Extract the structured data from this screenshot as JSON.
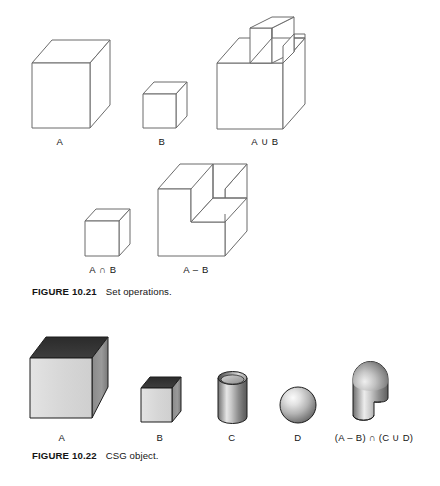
{
  "page": {
    "width": 440,
    "height": 486,
    "background": "#ffffff",
    "ink": "#141414"
  },
  "figures": [
    {
      "id": "figure-10-21",
      "caption_title": "FIGURE 10.21",
      "caption_text": "Set operations.",
      "style": "wireframe line drawing",
      "stroke_color": "#6b6b6b",
      "fill_color": "#ffffff",
      "shapes": [
        {
          "name": "cube-a",
          "label": "A",
          "label_x": 60,
          "label_y": 142,
          "description": "large wireframe cube"
        },
        {
          "name": "cube-b",
          "label": "B",
          "label_x": 162,
          "label_y": 142,
          "description": "small wireframe cube"
        },
        {
          "name": "union-a-b",
          "label": "A ∪ B",
          "label_x": 265,
          "label_y": 142,
          "description": "large cube with small cube fused on top rear corner"
        },
        {
          "name": "intersection-a-b",
          "label": "A ∩ B",
          "label_x": 103,
          "label_y": 270,
          "description": "small wireframe cube"
        },
        {
          "name": "difference-a-b",
          "label": "A – B",
          "label_x": 196,
          "label_y": 270,
          "description": "large cube with a cubic notch removed from top front right corner"
        }
      ]
    },
    {
      "id": "figure-10-22",
      "caption_title": "FIGURE 10.22",
      "caption_text": "CSG object.",
      "style": "shaded grayscale solids",
      "colors": {
        "top_face": "#333333",
        "front_face": "#d9d9d9",
        "side_face": "#8f8f8f",
        "outline": "#1a1a1a",
        "highlight": "#f2f2f2",
        "shadow": "#5a5a5a"
      },
      "shapes": [
        {
          "name": "solid-cube-a",
          "label": "A",
          "label_x": 62,
          "label_y": 438,
          "description": "large shaded cube, dark top face"
        },
        {
          "name": "solid-cube-b",
          "label": "B",
          "label_x": 160,
          "label_y": 438,
          "description": "small shaded cube, dark top face"
        },
        {
          "name": "solid-cylinder-c",
          "label": "C",
          "label_x": 232,
          "label_y": 438,
          "description": "shaded vertical cylinder with open top ellipse"
        },
        {
          "name": "solid-sphere-d",
          "label": "D",
          "label_x": 298,
          "label_y": 438,
          "description": "shaded sphere with upper-left highlight"
        },
        {
          "name": "csg-result",
          "label": "(A – B) ∩ (C ∪ D)",
          "label_x": 385,
          "label_y": 438,
          "description": "capsule / dome topped cylinder with rectangular notch cut from lower right"
        }
      ]
    }
  ]
}
